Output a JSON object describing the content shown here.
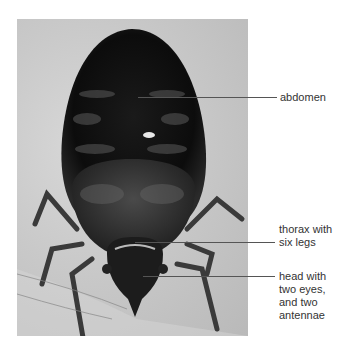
{
  "figure": {
    "labels": [
      {
        "id": "abdomen",
        "lines": [
          "abdomen"
        ]
      },
      {
        "id": "thorax",
        "lines": [
          "thorax with",
          "six legs"
        ]
      },
      {
        "id": "head",
        "lines": [
          "head with",
          "two eyes,",
          "and two",
          "antennae"
        ]
      }
    ]
  },
  "colors": {
    "background": "#ffffff",
    "photo_bg": "#c9c9c9",
    "body_dark": "#111111",
    "leader_line": "#555555",
    "label_text": "#333333"
  }
}
